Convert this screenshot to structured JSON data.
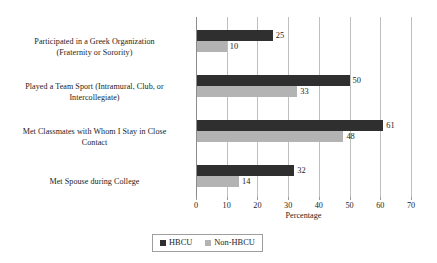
{
  "chart_data": {
    "type": "bar",
    "orientation": "horizontal",
    "title": "",
    "xlabel": "Percentage",
    "ylabel": "",
    "xlim": [
      0,
      70
    ],
    "xticks": [
      0,
      10,
      20,
      30,
      40,
      50,
      60,
      70
    ],
    "grid": "vertical",
    "legend_position": "bottom",
    "categories": [
      "Participated in a Greek Organization (Fraternity or Sorority)",
      "Played a Team Sport (Intramural, Club, or Intercollegiate)",
      "Met Classmates with Whom I Stay in Close Contact",
      "Met Spouse during College"
    ],
    "category_lines": [
      [
        "Participated in a Greek Organization",
        "(Fraternity or Sorority)"
      ],
      [
        "Played a Team Sport (Intramural, Club, or",
        "Intercollegiate)"
      ],
      [
        "Met Classmates with Whom I Stay in Close",
        "Contact"
      ],
      [
        "Met Spouse during College"
      ]
    ],
    "series": [
      {
        "name": "HBCU",
        "color": "#2f2f2f",
        "values": [
          25,
          50,
          61,
          32
        ]
      },
      {
        "name": "Non-HBCU",
        "color": "#b3b3b3",
        "values": [
          10,
          33,
          48,
          14
        ]
      }
    ],
    "data_labels": {
      "HBCU": [
        "25",
        "50",
        "61",
        "32"
      ],
      "Non-HBCU": [
        "10",
        "33",
        "48",
        "14"
      ]
    }
  },
  "legend": {
    "items": [
      {
        "label": "HBCU",
        "color": "#2f2f2f"
      },
      {
        "label": "Non-HBCU",
        "color": "#b3b3b3"
      }
    ]
  },
  "axis": {
    "x_title": "Percentage",
    "tick_labels": [
      "0",
      "10",
      "20",
      "30",
      "40",
      "50",
      "60",
      "70"
    ]
  }
}
